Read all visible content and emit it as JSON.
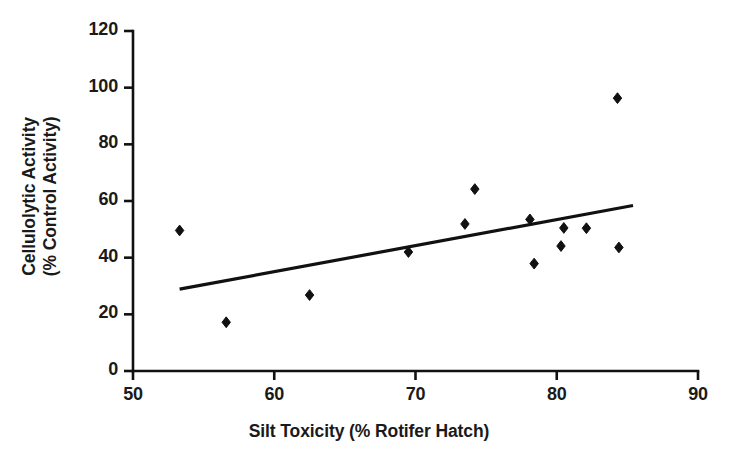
{
  "chart_data": {
    "type": "scatter",
    "title": "",
    "xlabel": "Silt Toxicity (% Rotifer Hatch)",
    "ylabel_line1": "Cellulolytic Activity",
    "ylabel_line2": "(% Control Activity)",
    "xlim": [
      50,
      90
    ],
    "ylim": [
      0,
      120
    ],
    "xticks": [
      50,
      60,
      70,
      80,
      90
    ],
    "xtick_labels": [
      "50",
      "60",
      "70",
      "80",
      "90"
    ],
    "yticks": [
      0,
      20,
      40,
      60,
      80,
      100,
      120
    ],
    "ytick_labels": [
      "0",
      "20",
      "40",
      "60",
      "80",
      "100",
      "120"
    ],
    "grid": false,
    "legend": null,
    "marker": "diamond",
    "marker_color": "#111111",
    "line_color": "#111111",
    "axis_color": "#111111",
    "background": "#ffffff",
    "points": [
      {
        "x": 53.3,
        "y": 49.6
      },
      {
        "x": 56.6,
        "y": 17.2
      },
      {
        "x": 62.5,
        "y": 26.8
      },
      {
        "x": 69.5,
        "y": 42.0
      },
      {
        "x": 73.5,
        "y": 51.9
      },
      {
        "x": 74.2,
        "y": 64.2
      },
      {
        "x": 78.1,
        "y": 53.5
      },
      {
        "x": 78.4,
        "y": 37.9
      },
      {
        "x": 80.3,
        "y": 44.1
      },
      {
        "x": 80.5,
        "y": 50.5
      },
      {
        "x": 82.1,
        "y": 50.4
      },
      {
        "x": 84.3,
        "y": 96.3
      },
      {
        "x": 84.4,
        "y": 43.6
      }
    ],
    "trendline": {
      "x_start": 53.3,
      "y_start": 28.9,
      "x_end": 85.4,
      "y_end": 58.4
    }
  }
}
